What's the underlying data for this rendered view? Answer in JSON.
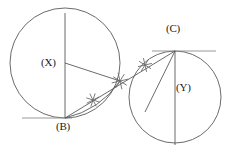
{
  "figure": {
    "type": "geometry-diagram",
    "background_color": "#ffffff",
    "stroke_color": "#5a5a5a",
    "label_color": "#1a1a1a"
  },
  "labels": {
    "center_left": "(X)",
    "center_right": "(Y)",
    "point_bottom": "(B)",
    "point_top": "(C)"
  },
  "shapes": {
    "circles": [
      {
        "name": "circle-x",
        "center_label": "(X)",
        "cx": 65,
        "cy": 63,
        "r": 55
      },
      {
        "name": "circle-y",
        "center_label": "(Y)",
        "cx": 175,
        "cy": 97,
        "r": 46
      }
    ],
    "points": [
      {
        "name": "point-b",
        "label": "(B)",
        "x": 65,
        "y": 118
      },
      {
        "name": "point-c",
        "label": "(C)",
        "x": 175,
        "y": 51
      },
      {
        "name": "point-x",
        "label": "(X)",
        "x": 65,
        "y": 63
      },
      {
        "name": "point-y",
        "label": "(Y)",
        "x": 175,
        "y": 97
      },
      {
        "name": "point-tangency",
        "label": "",
        "x": 120,
        "y": 81
      }
    ],
    "segments": [
      {
        "name": "diameter-x-vertical",
        "x1": 65,
        "y1": 13,
        "x2": 65,
        "y2": 118
      },
      {
        "name": "diameter-y-vertical",
        "x1": 175,
        "y1": 51,
        "x2": 175,
        "y2": 145
      },
      {
        "name": "radius-x-to-tangency",
        "x1": 65,
        "y1": 63,
        "x2": 120,
        "y2": 81
      },
      {
        "name": "chord-b-to-c",
        "x1": 65,
        "y1": 118,
        "x2": 175,
        "y2": 51
      },
      {
        "name": "radius-y-to-tangency",
        "x1": 175,
        "y1": 51,
        "x2": 145,
        "y2": 112
      }
    ],
    "tangent_lines": [
      {
        "name": "tangent-at-b",
        "x1": 22,
        "y1": 118,
        "x2": 72,
        "y2": 118
      },
      {
        "name": "tangent-at-c",
        "x1": 152,
        "y1": 51,
        "x2": 216,
        "y2": 51
      }
    ],
    "tick_marks": [
      {
        "name": "tick-on-segment-xb-arc",
        "x": 93,
        "y": 100,
        "angle": 18
      },
      {
        "name": "tick-on-tangency",
        "x": 120,
        "y": 81,
        "angle": 32
      },
      {
        "name": "tick-on-segment-yc",
        "x": 145,
        "y": 65,
        "angle": 32
      }
    ]
  }
}
